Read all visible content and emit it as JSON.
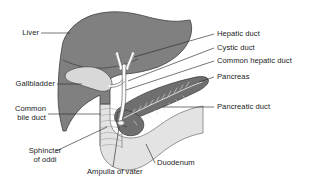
{
  "figure": {
    "background_color": "#ffffff",
    "outline_color": "#3a3a3a",
    "leader_line_color": "#2b2b2b",
    "text_color": "#1b1b1b"
  },
  "organs": {
    "liver": {
      "name": "Liver",
      "fill": "#808080",
      "stroke": "#3f3f3f"
    },
    "gallbladder": {
      "name": "Gallbladder",
      "fill": "#d8d8d8",
      "stroke": "#4a4a4a"
    },
    "pancreas": {
      "name": "Pancreas",
      "fill": "#6f6f6f",
      "stroke": "#3f3f3f"
    },
    "duodenum": {
      "name": "Duodenum",
      "fill": "#e3e3e3",
      "stroke": "#5a5a5a"
    },
    "ducts": {
      "name": "Bile ducts",
      "fill": "#fcfcfc",
      "stroke": "#4a4a4a"
    }
  },
  "labels": {
    "liver": "Liver",
    "gallbladder": "Gallbladder",
    "common_bile_duct_line1": "Common",
    "common_bile_duct_line2": "bile duct",
    "sphincter_line1": "Sphincter",
    "sphincter_line2": "of oddi",
    "ampulla_of_vater": "Ampulla of vater",
    "duodenum": "Duodenum",
    "hepatic_duct": "Hepatic duct",
    "cystic_duct": "Cystic duct",
    "common_hepatic_duct": "Common hepatic duct",
    "pancreas": "Pancreas",
    "pancreatic_duct": "Pancreatic duct"
  }
}
